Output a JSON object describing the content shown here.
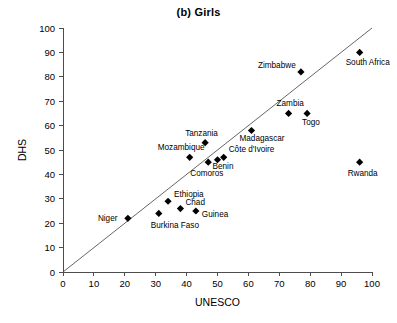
{
  "chart_data": {
    "type": "scatter",
    "title": "(b) Girls",
    "xlabel": "UNESCO",
    "ylabel": "DHS",
    "xlim": [
      0,
      100
    ],
    "ylim": [
      0,
      100
    ],
    "xticks": [
      0,
      10,
      20,
      30,
      40,
      50,
      60,
      70,
      80,
      90,
      100
    ],
    "yticks": [
      0,
      10,
      20,
      30,
      40,
      50,
      60,
      70,
      80,
      90,
      100
    ],
    "grid": false,
    "legend": "none",
    "annotations": [
      {
        "type": "reference-line",
        "description": "45-degree identity line",
        "from": [
          0,
          0
        ],
        "to": [
          100,
          100
        ]
      }
    ],
    "points": [
      {
        "label": "Niger",
        "x": 21,
        "y": 22,
        "label_dx": -30,
        "label_dy": 3
      },
      {
        "label": "Burkina Faso",
        "x": 31,
        "y": 24,
        "label_dx": -8,
        "label_dy": 15
      },
      {
        "label": "Ethiopia",
        "x": 34,
        "y": 29,
        "label_dx": 6,
        "label_dy": -4
      },
      {
        "label": "Chad",
        "x": 38,
        "y": 26,
        "label_dx": 5,
        "label_dy": -4
      },
      {
        "label": "Guinea",
        "x": 43,
        "y": 25,
        "label_dx": 6,
        "label_dy": 6
      },
      {
        "label": "Mozambique",
        "x": 41,
        "y": 47,
        "label_dx": -32,
        "label_dy": -7
      },
      {
        "label": "Comoros",
        "x": 47,
        "y": 45,
        "label_dx": -18,
        "label_dy": 14
      },
      {
        "label": "Benin",
        "x": 50,
        "y": 46,
        "label_dx": -5,
        "label_dy": 9
      },
      {
        "label": "Côte d'Ivoire",
        "x": 52,
        "y": 47,
        "label_dx": 5,
        "label_dy": -5
      },
      {
        "label": "Tanzania",
        "x": 46,
        "y": 53,
        "label_dx": -20,
        "label_dy": -7
      },
      {
        "label": "Madagascar",
        "x": 61,
        "y": 58,
        "label_dx": -12,
        "label_dy": 11
      },
      {
        "label": "Zambia",
        "x": 73,
        "y": 65,
        "label_dx": -12,
        "label_dy": -7
      },
      {
        "label": "Togo",
        "x": 79,
        "y": 65,
        "label_dx": -5,
        "label_dy": 12
      },
      {
        "label": "Zimbabwe",
        "x": 77,
        "y": 82,
        "label_dx": -43,
        "label_dy": -4
      },
      {
        "label": "South Africa",
        "x": 96,
        "y": 90,
        "label_dx": -14,
        "label_dy": 13
      },
      {
        "label": "Rwanda",
        "x": 96,
        "y": 45,
        "label_dx": -12,
        "label_dy": 14
      }
    ]
  }
}
